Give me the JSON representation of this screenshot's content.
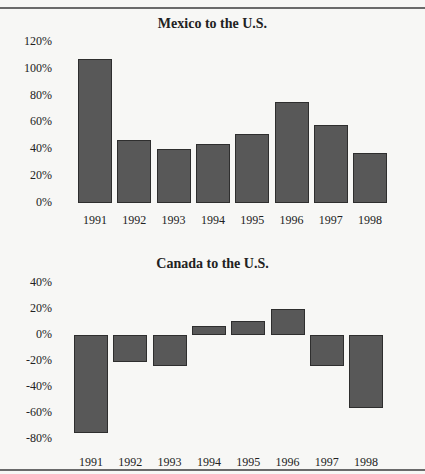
{
  "chart_data": [
    {
      "type": "bar",
      "title": "Mexico to the U.S.",
      "xlabel": "",
      "ylabel": "",
      "categories": [
        "1991",
        "1992",
        "1993",
        "1994",
        "1995",
        "1996",
        "1997",
        "1998"
      ],
      "values": [
        107,
        47,
        40,
        44,
        51,
        75,
        58,
        37
      ],
      "unit": "%",
      "yticks": [
        "120%",
        "100%",
        "80%",
        "60%",
        "40%",
        "20%",
        "0%"
      ],
      "ylim": [
        0,
        120
      ],
      "grid": false,
      "legend": null
    },
    {
      "type": "bar",
      "title": "Canada to the U.S.",
      "xlabel": "",
      "ylabel": "",
      "categories": [
        "1991",
        "1992",
        "1993",
        "1994",
        "1995",
        "1996",
        "1997",
        "1998"
      ],
      "values": [
        -75,
        -21,
        -24,
        7,
        11,
        20,
        -24,
        -56
      ],
      "unit": "%",
      "yticks": [
        "40%",
        "20%",
        "0%",
        "-20%",
        "-40%",
        "-60%",
        "-80%"
      ],
      "ylim": [
        -80,
        40
      ],
      "grid": false,
      "legend": null
    }
  ],
  "colors": {
    "bar_fill": "#585858",
    "bar_stroke": "#2e2e2e",
    "rule": "#6a6a6a"
  }
}
